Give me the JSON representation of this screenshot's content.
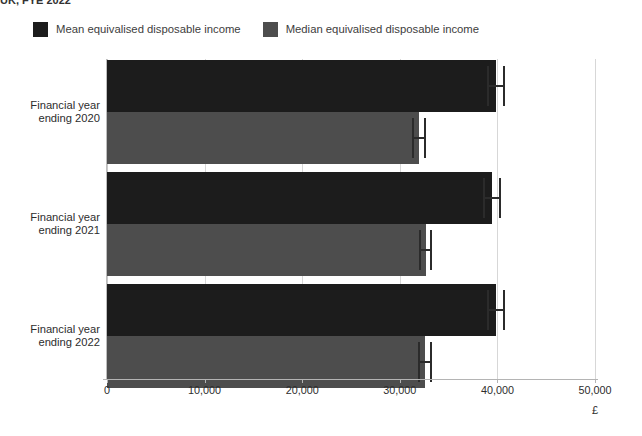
{
  "title": "UK, FYE 2022",
  "legend": {
    "position": "top-left",
    "items": [
      {
        "label": "Mean equivalised disposable income",
        "color": "#1c1c1c",
        "key": "mean"
      },
      {
        "label": "Median equivalised disposable income",
        "color": "#4d4d4d",
        "key": "median"
      }
    ]
  },
  "axis": {
    "x_title": "£",
    "x_ticks": [
      "0",
      "10,000",
      "20,000",
      "30,000",
      "40,000",
      "50,000"
    ],
    "y_categories": [
      {
        "line1": "Financial year",
        "line2": "ending 2020"
      },
      {
        "line1": "Financial year",
        "line2": "ending 2021"
      },
      {
        "line1": "Financial year",
        "line2": "ending 2022"
      }
    ]
  },
  "chart_data": {
    "type": "bar",
    "orientation": "horizontal",
    "title": "UK, FYE 2022",
    "xlabel": "£",
    "ylabel": "",
    "xlim": [
      0,
      50000
    ],
    "xticks": [
      0,
      10000,
      20000,
      30000,
      40000,
      50000
    ],
    "grid": true,
    "legend_position": "top-left",
    "categories": [
      "Financial year ending 2020",
      "Financial year ending 2021",
      "Financial year ending 2022"
    ],
    "series": [
      {
        "name": "Mean equivalised disposable income",
        "color": "#1c1c1c",
        "values": [
          39860,
          39450,
          39860
        ],
        "error_low": [
          38900,
          38500,
          38900
        ],
        "error_high": [
          40800,
          40400,
          40800
        ]
      },
      {
        "name": "Median equivalised disposable income",
        "color": "#4d4d4d",
        "values": [
          31970,
          32680,
          32600
        ],
        "error_low": [
          31300,
          32000,
          31900
        ],
        "error_high": [
          32650,
          33350,
          33300
        ]
      }
    ]
  }
}
